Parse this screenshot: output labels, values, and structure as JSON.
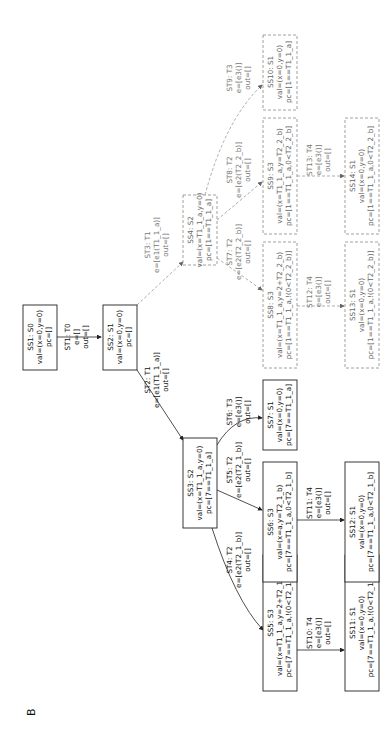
{
  "figure": {
    "panel_label": "B",
    "orientation": "rotated-90-ccw"
  },
  "nodes": [
    {
      "id": "SS1",
      "title": "SS1: S0",
      "val": "val=(x=0,y=0)",
      "pc": "pc=[]",
      "style": "solid"
    },
    {
      "id": "SS2",
      "title": "SS2: S1",
      "val": "val=(x=0,y=0)",
      "pc": "pc=[]",
      "style": "solid"
    },
    {
      "id": "SS3",
      "title": "SS3: S2",
      "val": "val=(x=T1_1_a,y=0)",
      "pc": "pc=[7==T1_1_a]",
      "style": "solid"
    },
    {
      "id": "SS4",
      "title": "SS4: S2",
      "val": "val=(x=T1_1_a,y=0)",
      "pc": "pc=[1==T1_1_a]",
      "style": "dashed"
    },
    {
      "id": "SS5",
      "title": "SS5: S3",
      "val": "val=(x=T1_1_a,y=2+T2_1_b)",
      "pc": "pc=[7==T1_1_a,!(0<T2_1_b)]",
      "style": "solid"
    },
    {
      "id": "SS6",
      "title": "SS6: S3",
      "val": "val=(x=a,y=T2_1_b)",
      "pc": "pc=[7==T1_1_a,0<T2_1_b]",
      "style": "solid"
    },
    {
      "id": "SS7",
      "title": "SS7: S1",
      "val": "val=(x=0,y=0)",
      "pc": "pc=[7==T1_1_a]",
      "style": "solid"
    },
    {
      "id": "SS8",
      "title": "SS8: S3",
      "val": "val=(x=T1_1_a,y=2+T2_2_b)",
      "pc": "pc=[1==T1_1_a,!(0<T2_2_b)]",
      "style": "dashed"
    },
    {
      "id": "SS9",
      "title": "SS9: S3",
      "val": "val=(x=T1_1_a,y=T2_2_b)",
      "pc": "pc=[1==T1_1_a,0<T2_2_b]",
      "style": "dashed"
    },
    {
      "id": "SS10",
      "title": "SS10: S1",
      "val": "val=(x=0,y=0)",
      "pc": "pc=[1==T1_1_a]",
      "style": "dashed"
    },
    {
      "id": "SS11",
      "title": "SS11: S1",
      "val": "val=(x=0,y=0)",
      "pc": "pc=[7==T1_1_a,!(0<T2_1_b)]",
      "style": "solid"
    },
    {
      "id": "SS12",
      "title": "SS12: S1",
      "val": "val=(x=0,y=0)",
      "pc": "pc=[7==T1_1_a,0<T2_1_b]",
      "style": "solid"
    },
    {
      "id": "SS13",
      "title": "SS13: S1",
      "val": "val=(x=0,y=0)",
      "pc": "pc=[1==T1_1_a,!(0<T2_2_b)]",
      "style": "dashed"
    },
    {
      "id": "SS14",
      "title": "SS14: S1",
      "val": "val=(x=0,y=0)",
      "pc": "pc=[1==T1_1_a,0<T2_2_b]",
      "style": "dashed"
    }
  ],
  "edges": [
    {
      "id": "ST1",
      "from": "SS1",
      "to": "SS2",
      "title": "ST1: T0",
      "e": "e=[]",
      "out": "out=[]",
      "style": "solid"
    },
    {
      "id": "ST2",
      "from": "SS2",
      "to": "SS3",
      "title": "ST2: T1",
      "e": "e=[e1(T1_1_a)]",
      "out": "out=[]",
      "style": "solid"
    },
    {
      "id": "ST3",
      "from": "SS2",
      "to": "SS4",
      "title": "ST3: T1",
      "e": "e=[e1(T1_1_a)]",
      "out": "out=[]",
      "style": "dashed"
    },
    {
      "id": "ST4",
      "from": "SS3",
      "to": "SS5",
      "title": "ST4: T2",
      "e": "e=[e2(T2_1_b)]",
      "out": "out=[]",
      "style": "solid"
    },
    {
      "id": "ST5",
      "from": "SS3",
      "to": "SS6",
      "title": "ST5: T2",
      "e": "e=[e2(T2_1_b)]",
      "out": "out=[]",
      "style": "solid"
    },
    {
      "id": "ST6",
      "from": "SS3",
      "to": "SS7",
      "title": "ST6: T3",
      "e": "e=[e3()]",
      "out": "out=[]",
      "style": "solid"
    },
    {
      "id": "ST7",
      "from": "SS4",
      "to": "SS8",
      "title": "ST7: T2",
      "e": "e=[e2(T2_2_b)]",
      "out": "out=[]",
      "style": "dashed"
    },
    {
      "id": "ST8",
      "from": "SS4",
      "to": "SS9",
      "title": "ST8: T2",
      "e": "e=[e2(T2_2_b)]",
      "out": "out=[]",
      "style": "dashed"
    },
    {
      "id": "ST9",
      "from": "SS4",
      "to": "SS10",
      "title": "ST9: T3",
      "e": "e=[e3()]",
      "out": "out=[]",
      "style": "dashed"
    },
    {
      "id": "ST10",
      "from": "SS5",
      "to": "SS11",
      "title": "ST10: T4",
      "e": "e=[e3()]",
      "out": "out=[]",
      "style": "solid"
    },
    {
      "id": "ST11",
      "from": "SS6",
      "to": "SS12",
      "title": "ST11: T4",
      "e": "e=[e3()]",
      "out": "out=[]",
      "style": "solid"
    },
    {
      "id": "ST12",
      "from": "SS8",
      "to": "SS13",
      "title": "ST12: T4",
      "e": "e=[e3()]",
      "out": "out=[]",
      "style": "dashed"
    },
    {
      "id": "ST13",
      "from": "SS9",
      "to": "SS14",
      "title": "ST13: T4",
      "e": "e=[e3()]",
      "out": "out=[]",
      "style": "dashed"
    }
  ]
}
